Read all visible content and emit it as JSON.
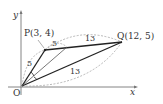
{
  "diagram": {
    "axes": {
      "x_label": "x",
      "y_label": "y",
      "origin_label": "O"
    },
    "points": {
      "P": {
        "label": "P(3, 4)"
      },
      "Q": {
        "label": "Q(12, 5)"
      }
    },
    "lengths": {
      "OP": "5",
      "P_to_bisector": "5",
      "PQ_arc": "13",
      "OQ": "13"
    }
  }
}
